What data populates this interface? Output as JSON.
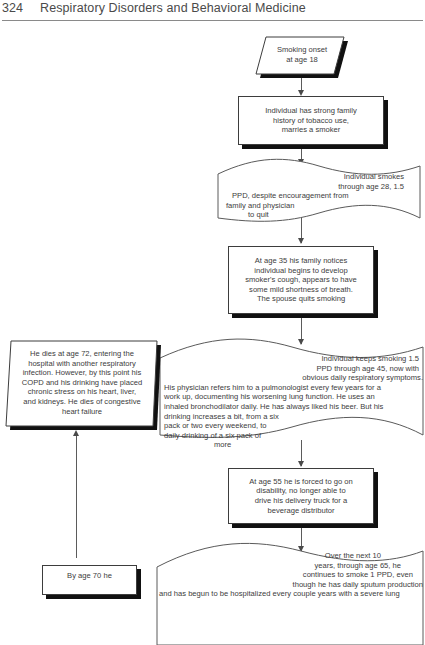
{
  "page": {
    "folio": "324",
    "running_title": "Respiratory Disorders and Behavioral Medicine"
  },
  "flowchart": {
    "title": "Natural history of smoking-related illness case flowchart",
    "nodes": [
      {
        "id": "smoking-onset",
        "shape": "parallelogram",
        "text": "Smoking onset\nat age 18"
      },
      {
        "id": "family-history",
        "shape": "rectangle",
        "text": "Individual has strong family\nhistory of tobacco use,\nmarries a smoker"
      },
      {
        "id": "smokes-through-28",
        "shape": "document-wave",
        "text_lines": [
          "Individual smokes",
          "through age 28, 1.5",
          "PPD, despite encouragement from",
          "family and physician",
          "to quit"
        ]
      },
      {
        "id": "age-35-cough",
        "shape": "rectangle",
        "text": "At age 35 his family notices\nindividual begins to develop\nsmoker's cough, appears to have\nsome mild shortness of breath.\nThe spouse quits smoking"
      },
      {
        "id": "smokes-through-45",
        "shape": "document-wave",
        "text_lines": [
          "Individual keeps smoking 1.5",
          "PPD through age 45, now with",
          "obvious daily respiratory symptoms.",
          "His physician refers him to a pulmonologist every few years for a",
          "work up, documenting his worsening lung function. He uses an",
          "inhaled bronchodilator daily. He has always liked his beer. But his",
          "drinking increases a bit, from a six",
          "pack or two every weekend, to",
          "daily drinking of a six pack of",
          "more"
        ]
      },
      {
        "id": "dies-at-72",
        "shape": "trapezoid",
        "text": "He dies at age 72, entering the\nhospital with another respiratory\ninfection. However, by this point his\nCOPD and his drinking have placed\nchronic stress on his heart, liver,\nand kidneys. He dies of congestive\nheart failure"
      },
      {
        "id": "age-55-disability",
        "shape": "rectangle",
        "text": "At age 55 he is forced to go on\ndisability, no longer able to\ndrive his delivery truck for a\nbeverage distributor"
      },
      {
        "id": "next-10-years",
        "shape": "document-wave",
        "text_lines": [
          "Over the next 10",
          "years, through age 65, he",
          "continues to smoke 1 PPD, even",
          "though he has daily sputum production",
          "and has begun to be hospitalized every couple years with a severe lung"
        ]
      },
      {
        "id": "by-age-70",
        "shape": "rectangle",
        "text": "By age 70 he"
      }
    ],
    "connectors": [
      {
        "id": "conn-onset-to-family",
        "direction": "down"
      },
      {
        "id": "conn-family-to-smokes28",
        "direction": "down"
      },
      {
        "id": "conn-smokes28-to-age35",
        "direction": "down"
      },
      {
        "id": "conn-age35-to-smokes45",
        "direction": "down"
      },
      {
        "id": "conn-smokes45-to-age55",
        "direction": "down"
      },
      {
        "id": "conn-age55-to-next10",
        "direction": "down"
      },
      {
        "id": "conn-age70-to-dies72",
        "direction": "up"
      }
    ]
  },
  "colors": {
    "ink": "#3c3c3c",
    "outline": "#3d3d3d",
    "shadow": "#111111",
    "connector": "#5b5b5b",
    "rule": "#8a8a8a",
    "paper": "#ffffff"
  }
}
